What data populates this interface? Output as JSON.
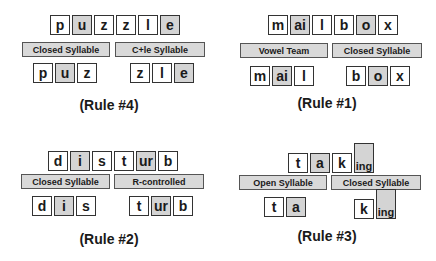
{
  "panels": [
    {
      "id": "puzzle",
      "word": [
        {
          "t": "p",
          "shaded": false
        },
        {
          "t": "u",
          "shaded": true
        },
        {
          "t": "z",
          "shaded": false
        },
        {
          "t": "z",
          "shaded": false
        },
        {
          "t": "l",
          "shaded": false
        },
        {
          "t": "e",
          "shaded": true
        }
      ],
      "labels": [
        "Closed Syllable",
        "C+le Syllable"
      ],
      "syllables": [
        [
          {
            "t": "p",
            "shaded": false
          },
          {
            "t": "u",
            "shaded": true
          },
          {
            "t": "z",
            "shaded": false
          }
        ],
        [
          {
            "t": "z",
            "shaded": false
          },
          {
            "t": "l",
            "shaded": false
          },
          {
            "t": "e",
            "shaded": true
          }
        ]
      ],
      "rule": "(Rule #4)"
    },
    {
      "id": "mailbox",
      "word": [
        {
          "t": "m",
          "shaded": false
        },
        {
          "t": "ai",
          "shaded": true
        },
        {
          "t": "l",
          "shaded": false
        },
        {
          "t": "b",
          "shaded": false
        },
        {
          "t": "o",
          "shaded": true
        },
        {
          "t": "x",
          "shaded": false
        }
      ],
      "labels": [
        "Vowel Team",
        "Closed Syllable"
      ],
      "syllables": [
        [
          {
            "t": "m",
            "shaded": false
          },
          {
            "t": "ai",
            "shaded": true
          },
          {
            "t": "l",
            "shaded": false
          }
        ],
        [
          {
            "t": "b",
            "shaded": false
          },
          {
            "t": "o",
            "shaded": true
          },
          {
            "t": "x",
            "shaded": false
          }
        ]
      ],
      "rule": "(Rule #1)"
    },
    {
      "id": "disturb",
      "word": [
        {
          "t": "d",
          "shaded": false
        },
        {
          "t": "i",
          "shaded": true
        },
        {
          "t": "s",
          "shaded": false
        },
        {
          "t": "t",
          "shaded": false
        },
        {
          "t": "ur",
          "shaded": true
        },
        {
          "t": "b",
          "shaded": false
        }
      ],
      "labels": [
        "Closed Syllable",
        "R-controlled"
      ],
      "syllables": [
        [
          {
            "t": "d",
            "shaded": false
          },
          {
            "t": "i",
            "shaded": true
          },
          {
            "t": "s",
            "shaded": false
          }
        ],
        [
          {
            "t": "t",
            "shaded": false
          },
          {
            "t": "ur",
            "shaded": true
          },
          {
            "t": "b",
            "shaded": false
          }
        ]
      ],
      "rule": "(Rule #2)"
    },
    {
      "id": "taking",
      "word": [
        {
          "t": "t",
          "shaded": false
        },
        {
          "t": "a",
          "shaded": true
        },
        {
          "t": "k",
          "shaded": false
        },
        {
          "t": "ing",
          "shaded": true,
          "tall": true
        }
      ],
      "labels": [
        "Open Syllable",
        "Closed Syllable"
      ],
      "syllables": [
        [
          {
            "t": "t",
            "shaded": false
          },
          {
            "t": "a",
            "shaded": true
          }
        ],
        [
          {
            "t": "k",
            "shaded": false
          },
          {
            "t": "ing",
            "shaded": true,
            "tall": true
          }
        ]
      ],
      "rule": "(Rule #3)"
    }
  ],
  "colors": {
    "shaded": "#d4d4d4",
    "label_bg": "#d9d9d9",
    "border": "#333333"
  }
}
